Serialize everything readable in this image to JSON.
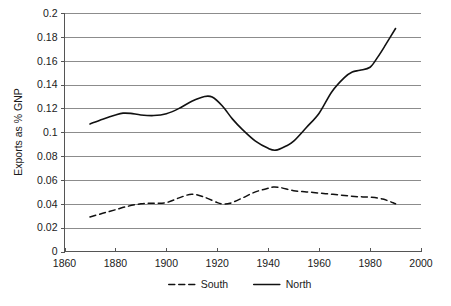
{
  "chart_data": {
    "type": "line",
    "title": "",
    "xlabel": "",
    "ylabel": "Exports as % GNP",
    "xlim": [
      1860,
      2000
    ],
    "ylim": [
      0,
      0.2
    ],
    "grid": true,
    "legend_position": "bottom",
    "xticks": [
      1860,
      1880,
      1900,
      1920,
      1940,
      1960,
      1980,
      2000
    ],
    "xtick_labels": [
      "1860",
      "1880",
      "1900",
      "1920",
      "1940",
      "1960",
      "1980",
      "2000"
    ],
    "yticks": [
      0,
      0.02,
      0.04,
      0.06,
      0.08,
      0.1,
      0.12,
      0.14,
      0.16,
      0.18,
      0.2
    ],
    "ytick_labels": [
      "0",
      "0.02",
      "0.04",
      "0.06",
      "0.08",
      "0.1",
      "0.12",
      "0.14",
      "0.16",
      "0.18",
      "0.2"
    ],
    "series": [
      {
        "name": "South",
        "style": "dashed",
        "color": "#111111",
        "x": [
          1870,
          1875,
          1880,
          1885,
          1890,
          1895,
          1900,
          1905,
          1910,
          1915,
          1920,
          1922,
          1925,
          1930,
          1935,
          1940,
          1942,
          1945,
          1950,
          1955,
          1960,
          1965,
          1970,
          1975,
          1980,
          1985,
          1990
        ],
        "values": [
          0.029,
          0.032,
          0.035,
          0.038,
          0.04,
          0.0405,
          0.041,
          0.045,
          0.048,
          0.0455,
          0.041,
          0.04,
          0.0405,
          0.045,
          0.05,
          0.053,
          0.054,
          0.0535,
          0.051,
          0.05,
          0.049,
          0.048,
          0.047,
          0.046,
          0.0455,
          0.044,
          0.04
        ]
      },
      {
        "name": "North",
        "style": "solid",
        "color": "#111111",
        "x": [
          1870,
          1875,
          1880,
          1883,
          1886,
          1890,
          1895,
          1900,
          1905,
          1910,
          1915,
          1918,
          1922,
          1926,
          1930,
          1935,
          1940,
          1943,
          1947,
          1950,
          1955,
          1960,
          1965,
          1970,
          1973,
          1976,
          1980,
          1983,
          1986,
          1990
        ],
        "values": [
          0.107,
          0.111,
          0.1145,
          0.116,
          0.1158,
          0.1145,
          0.114,
          0.1155,
          0.12,
          0.126,
          0.13,
          0.1295,
          0.122,
          0.111,
          0.102,
          0.0925,
          0.0865,
          0.085,
          0.0885,
          0.0925,
          0.104,
          0.116,
          0.134,
          0.146,
          0.1505,
          0.152,
          0.1545,
          0.163,
          0.173,
          0.187
        ]
      }
    ]
  },
  "legend": {
    "items": [
      {
        "label": "South",
        "style": "dashed"
      },
      {
        "label": "North",
        "style": "solid"
      }
    ]
  },
  "axis": {
    "y_title": "Exports as % GNP"
  }
}
